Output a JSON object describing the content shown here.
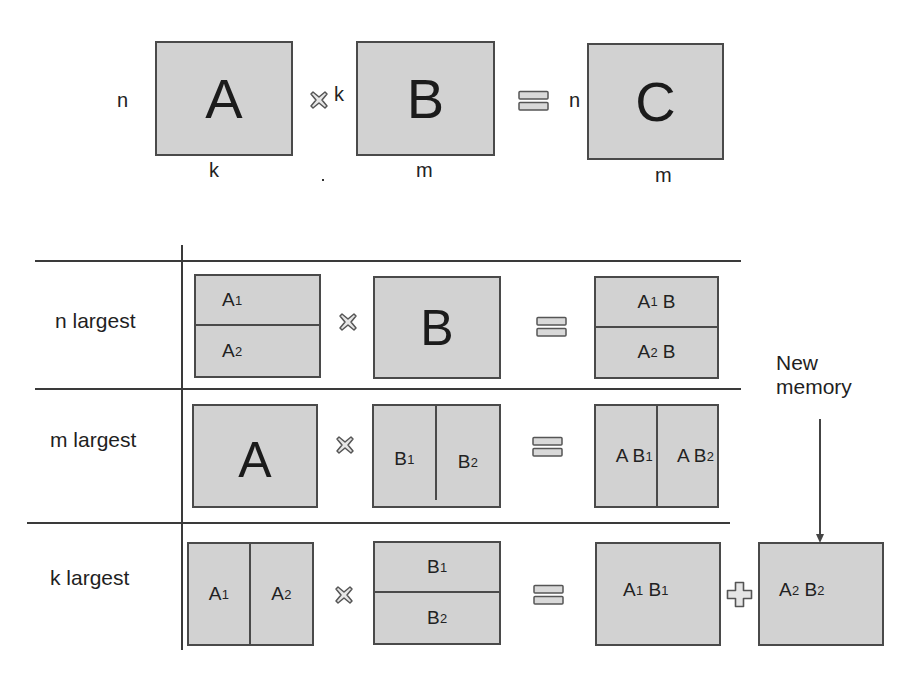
{
  "diagram": {
    "type": "matrix-multiplication-partitioning",
    "colors": {
      "box_fill": "#d2d2d2",
      "box_border": "#4a4a4a",
      "line": "#3a3a3a",
      "text": "#1e1e1e"
    },
    "top_equation": {
      "matrix_a": {
        "label": "A",
        "rows_dim": "n",
        "cols_dim": "k"
      },
      "operator_multiply": "multiply-icon",
      "matrix_b": {
        "label": "B",
        "rows_dim": "k",
        "cols_dim": "m"
      },
      "operator_equals": "equals-icon",
      "matrix_c": {
        "label": "C",
        "rows_dim": "n",
        "cols_dim": "m"
      }
    },
    "rows": [
      {
        "label": "n largest",
        "left": {
          "split": "horizontal",
          "parts": [
            {
              "base": "A",
              "sub": "1"
            },
            {
              "base": "A",
              "sub": "2"
            }
          ]
        },
        "right": {
          "split": "none",
          "parts": [
            {
              "base": "B",
              "sub": ""
            }
          ]
        },
        "result": {
          "split": "horizontal",
          "parts": [
            {
              "pre": "A",
              "sub": "1",
              "post": " B"
            },
            {
              "pre": "A",
              "sub": "2",
              "post": " B"
            }
          ]
        }
      },
      {
        "label": "m largest",
        "left": {
          "split": "none",
          "parts": [
            {
              "base": "A",
              "sub": ""
            }
          ]
        },
        "right": {
          "split": "vertical",
          "parts": [
            {
              "base": "B",
              "sub": "1"
            },
            {
              "base": "B",
              "sub": "2"
            }
          ]
        },
        "result": {
          "split": "vertical",
          "parts": [
            {
              "pre": "A B",
              "sub": "1",
              "post": ""
            },
            {
              "pre": "A B",
              "sub": "2",
              "post": ""
            }
          ]
        }
      },
      {
        "label": "k largest",
        "left": {
          "split": "vertical",
          "parts": [
            {
              "base": "A",
              "sub": "1"
            },
            {
              "base": "A",
              "sub": "2"
            }
          ]
        },
        "right": {
          "split": "horizontal",
          "parts": [
            {
              "base": "B",
              "sub": "1"
            },
            {
              "base": "B",
              "sub": "2"
            }
          ]
        },
        "result": {
          "split": "none",
          "parts": [
            {
              "pre": "A",
              "sub": "1",
              "post": " B"
            }
          ]
        },
        "result_sub2": "1",
        "operator_plus": "plus-icon",
        "extra_result": {
          "pre": "A",
          "sub": "2",
          "post": " B",
          "sub2": "2"
        }
      }
    ],
    "annotation": {
      "line1": "New",
      "line2": "memory",
      "arrow_target": "extra-result-box"
    }
  }
}
